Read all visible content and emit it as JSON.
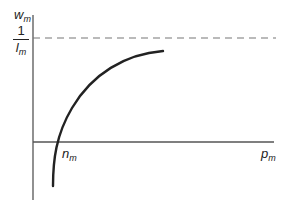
{
  "diagram": {
    "y_axis_label": {
      "base": "w",
      "sub": "m"
    },
    "x_axis_label": {
      "base": "p",
      "sub": "m"
    },
    "asymptote_label": {
      "numerator": "1",
      "denominator_base": "l",
      "denominator_sub": "m"
    },
    "intercept_label": {
      "base": "n",
      "sub": "m"
    },
    "colors": {
      "ink": "#222222",
      "axis": "#555555",
      "dashed": "#777777"
    }
  }
}
